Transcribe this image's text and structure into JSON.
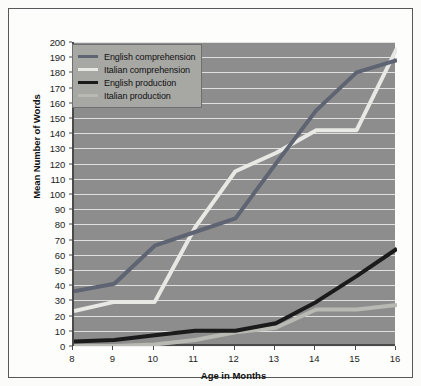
{
  "chart_data": {
    "type": "line",
    "title": "",
    "xlabel": "Age in Months",
    "ylabel": "Mean Number of Words",
    "x": [
      8,
      9,
      10,
      11,
      12,
      13,
      14,
      15,
      16
    ],
    "xlim": [
      8,
      16
    ],
    "ylim": [
      0,
      200
    ],
    "ytick_step": 10,
    "grid": "horizontal",
    "legend_position": "top-left",
    "xticks": [
      "8",
      "9",
      "10",
      "11",
      "12",
      "13",
      "14",
      "15",
      "16"
    ],
    "yticks": [
      "0",
      "10",
      "20",
      "30",
      "40",
      "50",
      "60",
      "70",
      "80",
      "90",
      "100",
      "110",
      "120",
      "130",
      "140",
      "150",
      "160",
      "170",
      "180",
      "190",
      "200"
    ],
    "series": [
      {
        "name": "English comprehension",
        "color": "#5e6472",
        "width": 4,
        "values": [
          36,
          41,
          66,
          75,
          84,
          120,
          155,
          180,
          188
        ]
      },
      {
        "name": "Italian comprehension",
        "color": "#e8e8e4",
        "width": 4,
        "values": [
          23,
          29,
          29,
          78,
          115,
          127,
          142,
          142,
          196
        ]
      },
      {
        "name": "English production",
        "color": "#1b1b1b",
        "width": 4,
        "values": [
          3,
          4,
          7,
          10,
          10,
          15,
          29,
          46,
          64
        ]
      },
      {
        "name": "Italian production",
        "color": "#b9b9b4",
        "width": 4,
        "values": [
          0,
          0,
          1,
          4,
          9,
          12,
          24,
          24,
          27
        ]
      }
    ]
  },
  "style": {
    "plot_background": "#8d8d8d",
    "figure_background": "#fdfdfc",
    "gridline_color": "#efefef",
    "axis_color": "#4a4a4a",
    "legend_background": "#a7a7a4",
    "frame_border": "#58585a"
  }
}
